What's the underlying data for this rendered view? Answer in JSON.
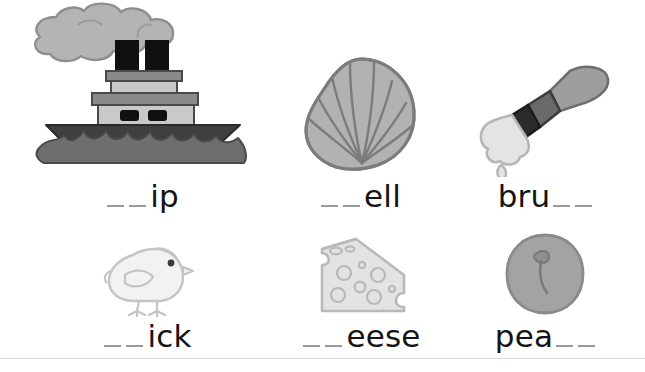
{
  "worksheet": {
    "title": "Digraph picture word worksheet",
    "background_color": "#ffffff",
    "text_color": "#141414",
    "blank_color": "#9a9a9a",
    "divider_color": "#d9dde0"
  },
  "items": [
    {
      "id": "ship",
      "icon": "steamship-icon",
      "blank_position": "lead",
      "blank_count": 2,
      "word_fragment": "ip",
      "label_text": "__ip"
    },
    {
      "id": "shell",
      "icon": "seashell-icon",
      "blank_position": "lead",
      "blank_count": 2,
      "word_fragment": "ell",
      "label_text": "__ell"
    },
    {
      "id": "brush",
      "icon": "paintbrush-icon",
      "blank_position": "trail",
      "blank_count": 2,
      "word_fragment": "bru",
      "label_text": "bru__"
    },
    {
      "id": "chick",
      "icon": "chick-icon",
      "blank_position": "lead",
      "blank_count": 2,
      "word_fragment": "ick",
      "label_text": "__ick"
    },
    {
      "id": "cheese",
      "icon": "cheese-wedge-icon",
      "blank_position": "lead",
      "blank_count": 2,
      "word_fragment": "eese",
      "label_text": "__eese"
    },
    {
      "id": "peach",
      "icon": "peach-icon",
      "blank_position": "trail",
      "blank_count": 2,
      "word_fragment": "pea",
      "label_text": "pea__"
    }
  ],
  "colors": {
    "hull_dark": "#3f3f3f",
    "wave_gray": "#6e6e6e",
    "cabin_light": "#c9c9c9",
    "deck_mid": "#8a8a8a",
    "stack_black": "#101010",
    "smoke_gray": "#b4b4b4",
    "smoke_outline": "#8e8e8e",
    "shell_fill": "#b2b2b2",
    "shell_line": "#7c7c7c",
    "brush_handle": "#9e9e9e",
    "brush_ferrule": "#6a6a6a",
    "brush_band": "#2b2b2b",
    "brush_bristle": "#e4e4e4",
    "chick_fill": "#f2f2f2",
    "chick_line": "#c4c4c4",
    "cheese_fill": "#e3e3e3",
    "cheese_line": "#b9b9b9",
    "peach_fill": "#a3a3a3",
    "peach_line": "#8a8a8a"
  }
}
